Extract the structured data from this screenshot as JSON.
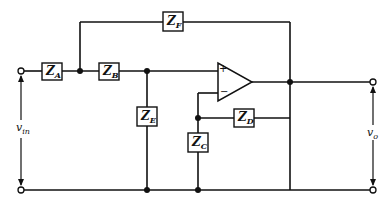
{
  "diagram": {
    "type": "op-amp active filter circuit",
    "components": [
      {
        "id": "ZA",
        "label": "Z",
        "sub": "A"
      },
      {
        "id": "ZB",
        "label": "Z",
        "sub": "B"
      },
      {
        "id": "ZF",
        "label": "Z",
        "sub": "F"
      },
      {
        "id": "ZE",
        "label": "Z",
        "sub": "E"
      },
      {
        "id": "ZD",
        "label": "Z",
        "sub": "D"
      },
      {
        "id": "ZC",
        "label": "Z",
        "sub": "C"
      }
    ],
    "opamp": {
      "plus": "+",
      "minus": "−"
    },
    "signals": {
      "input": {
        "label": "v",
        "sub": "in"
      },
      "output": {
        "label": "v",
        "sub": "o"
      }
    }
  }
}
